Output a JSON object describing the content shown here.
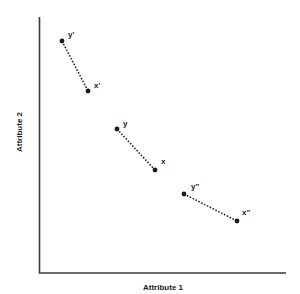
{
  "diagram": {
    "x_axis_label": "Attribute 1",
    "y_axis_label": "Attribute 2",
    "pairs": [
      {
        "from": {
          "label": "y'",
          "x": 62,
          "y": 41,
          "label_x": 68,
          "label_y": 37
        },
        "to": {
          "label": "x'",
          "x": 88,
          "y": 91,
          "label_x": 94,
          "label_y": 88
        }
      },
      {
        "from": {
          "label": "y",
          "x": 117,
          "y": 129,
          "label_x": 123,
          "label_y": 126
        },
        "to": {
          "label": "x",
          "x": 155,
          "y": 170,
          "label_x": 161,
          "label_y": 164
        }
      },
      {
        "from": {
          "label": "y\"",
          "x": 184,
          "y": 194,
          "label_x": 191,
          "label_y": 189
        },
        "to": {
          "label": "x\"",
          "x": 237,
          "y": 221,
          "label_x": 242,
          "label_y": 215
        }
      }
    ],
    "colors": {
      "axis": "#3a3a3a",
      "points": "#1a1a1a",
      "background": "#ffffff"
    }
  }
}
